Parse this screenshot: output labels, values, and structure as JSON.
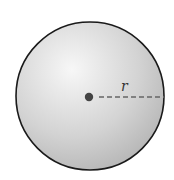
{
  "diagram": {
    "type": "sphere",
    "label": "r",
    "colors": {
      "outline": "#1a1a1a",
      "fill_light": "#f2f2f2",
      "fill_dark": "#b9b9b9",
      "dash": "#666666",
      "center_dot": "#444444"
    }
  }
}
